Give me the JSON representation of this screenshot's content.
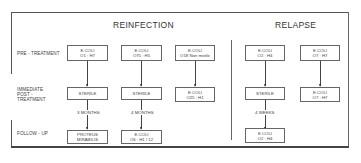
{
  "sections": {
    "reinfection": "REINFECTION",
    "relapse": "RELAPSE"
  },
  "row_labels": {
    "pre_treatment": "PRE - TREATMENT",
    "immediate_post_treatment_1": "IMMEDIATE",
    "immediate_post_treatment_2": "POST -",
    "immediate_post_treatment_3": "TREATMENT",
    "follow_up": "FOLLOW - UP"
  },
  "columns": [
    {
      "group": "reinfection",
      "pre": [
        "E.COLI",
        "O1 : H7"
      ],
      "post": [
        "STERILE"
      ],
      "interval": "3 MONTHS",
      "follow": [
        "PROTEUS",
        "MIRABILIS"
      ]
    },
    {
      "group": "reinfection",
      "pre": [
        "E.COLI",
        "O75 : H5"
      ],
      "post": [
        "STERILE"
      ],
      "interval": "4 MONTHS",
      "follow": [
        "E.COLI",
        "O6 : H1 / 12"
      ]
    },
    {
      "group": "reinfection",
      "pre": [
        "E.COLI",
        "O18 Non motile"
      ],
      "post": [
        "E.COLI",
        "O25 : H1"
      ]
    },
    {
      "group": "relapse",
      "pre": [
        "E.COLI",
        "O2 : H4"
      ],
      "post": [
        "STERILE"
      ],
      "interval": "4 WEEKS",
      "follow": [
        "E.COLI",
        "O2 : H4"
      ]
    },
    {
      "group": "relapse",
      "pre": [
        "E.COLI",
        "O7 : H7"
      ],
      "post": [
        "E.COLI",
        "O7 : H7"
      ]
    }
  ]
}
